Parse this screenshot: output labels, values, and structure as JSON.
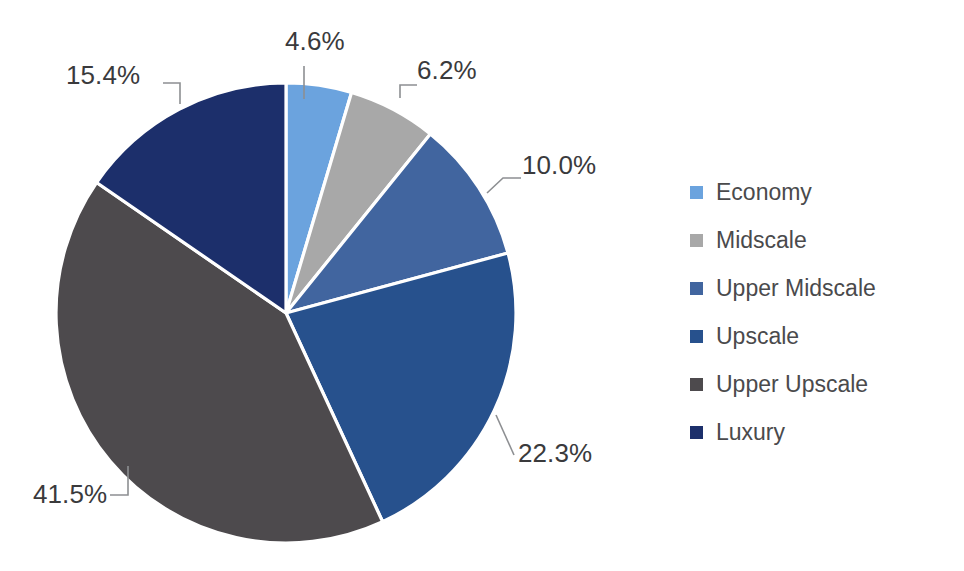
{
  "chart_data": {
    "type": "pie",
    "title": "",
    "subtitle": "",
    "xlabel": "",
    "ylabel": "",
    "grid": false,
    "legend_position": "right",
    "start_angle_deg": 0,
    "direction": "clockwise",
    "units": "percent",
    "total": 100.0,
    "categories": [
      "Economy",
      "Midscale",
      "Upper Midscale",
      "Upscale",
      "Upper Upscale",
      "Luxury"
    ],
    "values": [
      4.6,
      6.2,
      10.0,
      22.3,
      41.5,
      15.4
    ],
    "data_labels": [
      "4.6%",
      "6.2%",
      "10.0%",
      "22.3%",
      "41.5%",
      "15.4%"
    ],
    "colors": [
      "#6ba3de",
      "#a8a8a8",
      "#41659f",
      "#27518d",
      "#4d4a4d",
      "#1c2f6b"
    ],
    "slices": [
      {
        "label": "Economy",
        "value": 4.6,
        "data_label": "4.6%",
        "color": "#6ba3de"
      },
      {
        "label": "Midscale",
        "value": 6.2,
        "data_label": "6.2%",
        "color": "#a8a8a8"
      },
      {
        "label": "Upper Midscale",
        "value": 10.0,
        "data_label": "10.0%",
        "color": "#41659f"
      },
      {
        "label": "Upscale",
        "value": 22.3,
        "data_label": "22.3%",
        "color": "#27518d"
      },
      {
        "label": "Upper Upscale",
        "value": 41.5,
        "data_label": "41.5%",
        "color": "#4d4a4d"
      },
      {
        "label": "Luxury",
        "value": 15.4,
        "data_label": "15.4%",
        "color": "#1c2f6b"
      }
    ]
  },
  "labels": {
    "economy_pct": "4.6%",
    "midscale_pct": "6.2%",
    "upper_midscale_pct": "10.0%",
    "upscale_pct": "22.3%",
    "upper_upscale_pct": "41.5%",
    "luxury_pct": "15.4%"
  },
  "legend": {
    "items": [
      {
        "label": "Economy",
        "color": "#6ba3de"
      },
      {
        "label": "Midscale",
        "color": "#a8a8a8"
      },
      {
        "label": "Upper Midscale",
        "color": "#41659f"
      },
      {
        "label": "Upscale",
        "color": "#27518d"
      },
      {
        "label": "Upper Upscale",
        "color": "#4d4a4d"
      },
      {
        "label": "Luxury",
        "color": "#1c2f6b"
      }
    ]
  },
  "theme": {
    "background": "#ffffff",
    "label_text": "#3a3a3c",
    "legend_text": "#4a4a4c",
    "leader_line": "#8d8f92",
    "slice_border": "#ffffff"
  }
}
